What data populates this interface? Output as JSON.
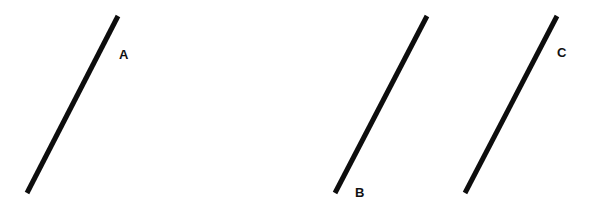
{
  "diagram": {
    "background": "#ffffff",
    "stroke_color": "#0d0d0d",
    "stroke_width": 5,
    "segments": [
      {
        "label": "A",
        "x1": 118,
        "y1": 16,
        "x2": 27,
        "y2": 193,
        "label_x": 119,
        "label_y": 48
      },
      {
        "label": "B",
        "x1": 427,
        "y1": 16,
        "x2": 335,
        "y2": 193,
        "label_x": 355,
        "label_y": 186
      },
      {
        "label": "C",
        "x1": 557,
        "y1": 16,
        "x2": 465,
        "y2": 193,
        "label_x": 557,
        "label_y": 46
      }
    ]
  }
}
